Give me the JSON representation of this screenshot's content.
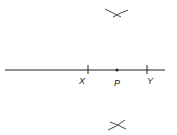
{
  "diagram": {
    "type": "geometric-construction",
    "labels": {
      "x": "X",
      "p": "P",
      "y": "Y"
    },
    "colors": {
      "stroke": "#222222",
      "background": "#ffffff"
    }
  }
}
